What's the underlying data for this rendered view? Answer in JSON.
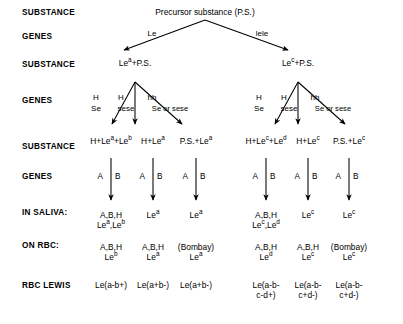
{
  "figure": {
    "caption_partial": ""
  },
  "row_labels": [
    {
      "id": "substance-1",
      "text": "SUBSTANCE",
      "y": 8
    },
    {
      "id": "genes-1",
      "text": "GENES",
      "y": 32
    },
    {
      "id": "substance-2",
      "text": "SUBSTANCE",
      "y": 60
    },
    {
      "id": "genes-2",
      "text": "GENES",
      "y": 96
    },
    {
      "id": "substance-3",
      "text": "SUBSTANCE",
      "y": 142
    },
    {
      "id": "genes-3",
      "text": "GENES",
      "y": 172
    },
    {
      "id": "in-saliva",
      "text": "IN SALIVA:",
      "y": 208
    },
    {
      "id": "on-rbc",
      "text": "ON RBC:",
      "y": 241
    },
    {
      "id": "phenotype",
      "text": "RBC LEWIS",
      "y": 281
    },
    {
      "id": "phenotype-2",
      "text": "PHENOTYPE",
      "y": 291
    }
  ],
  "root": {
    "label": "Precursor substance (P.S.)",
    "x": 205,
    "y": 8
  },
  "top_genes": [
    {
      "id": "le",
      "label": "Le",
      "x": 152,
      "y": 30
    },
    {
      "id": "lele",
      "label": "lele",
      "x": 262,
      "y": 30
    }
  ],
  "mid_substances": [
    {
      "id": "lea-ps",
      "html": "Le<sup>a</sup>+P.S.",
      "x": 135,
      "y": 59
    },
    {
      "id": "lec-ps",
      "html": "Le<sup>c</sup>+P.S.",
      "x": 298,
      "y": 59
    }
  ],
  "gene_groups": [
    {
      "id": "grp-left",
      "top": [
        "H",
        "H",
        "hh"
      ],
      "bottom": [
        "Se",
        "sese",
        "Se or sese"
      ],
      "top_x": [
        96,
        121,
        152
      ],
      "bottom_x": [
        96,
        126,
        170
      ],
      "top_y": 94,
      "bottom_y": 105
    },
    {
      "id": "grp-right",
      "top": [
        "H",
        "H",
        "hh"
      ],
      "bottom": [
        "Se",
        "sese",
        "Se or sese"
      ],
      "top_x": [
        259,
        284,
        315
      ],
      "bottom_x": [
        259,
        289,
        333
      ],
      "top_y": 94,
      "bottom_y": 105
    }
  ],
  "columns": [
    {
      "id": "col-1",
      "x": 111,
      "substance_html": "H+Le<sup>a</sup>+Le<sup>b</sup>",
      "genes": [
        "A",
        "B"
      ],
      "saliva_html": "A,B,H<br>Le<sup>a</sup>,Le<sup>b</sup>",
      "rbc_html": "A,B,H<br>Le<sup>b</sup>",
      "phenotype_html": "Le(a-b+)"
    },
    {
      "id": "col-2",
      "x": 153,
      "substance_html": "H+Le<sup>a</sup>",
      "genes": [
        "A",
        "B"
      ],
      "saliva_html": "Le<sup>a</sup>",
      "rbc_html": "A,B,H<br>Le<sup>a</sup>",
      "phenotype_html": "Le(a+b-)"
    },
    {
      "id": "col-3",
      "x": 196,
      "substance_html": "P.S.+Le<sup>a</sup>",
      "genes": [
        "A",
        "B"
      ],
      "saliva_html": "Le<sup>a</sup>",
      "rbc_html": "(Bombay)<br>Le<sup>a</sup>",
      "phenotype_html": "Le(a+b-)"
    },
    {
      "id": "col-4",
      "x": 266,
      "substance_html": "H+Le<sup>c</sup>+Le<sup>d</sup>",
      "genes": [
        "A",
        "B"
      ],
      "saliva_html": "A,B,H<br>Le<sup>c</sup>,Le<sup>d</sup>",
      "rbc_html": "A,B,H<br>Le<sup>d</sup>",
      "phenotype_html": "Le(a-b-<br>c-d+)"
    },
    {
      "id": "col-5",
      "x": 308,
      "substance_html": "H+Le<sup>c</sup>",
      "genes": [
        "A",
        "B"
      ],
      "saliva_html": "Le<sup>c</sup>",
      "rbc_html": "A,B,H<br>Le<sup>c</sup>",
      "phenotype_html": "Le(a-b-<br>c+d-)"
    },
    {
      "id": "col-6",
      "x": 349,
      "substance_html": "P.S.+Le<sup>c</sup>",
      "genes": [
        "A",
        "B"
      ],
      "saliva_html": "Le<sup>c</sup>",
      "rbc_html": "(Bombay)<br>Le<sup>c</sup>",
      "phenotype_html": "Le(a-b-<br>c+d-)"
    }
  ],
  "colors": {
    "ink": "#000000",
    "background": "#ffffff"
  }
}
